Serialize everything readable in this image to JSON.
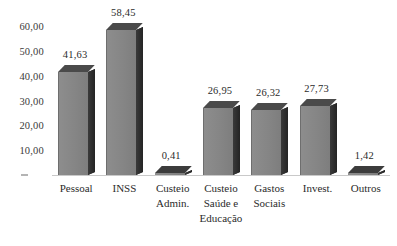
{
  "chart_data": {
    "type": "bar",
    "title": "",
    "subtitle": "",
    "xlabel": "",
    "ylabel": "",
    "categories": [
      "Pessoal",
      "INSS",
      "Custeio Admin.",
      "Custeio Saúde e Educação",
      "Gastos Sociais",
      "Invest.",
      "Outros"
    ],
    "category_lines": [
      [
        "Pessoal"
      ],
      [
        "INSS"
      ],
      [
        "Custeio",
        "Admin."
      ],
      [
        "Custeio",
        "Saúde e",
        "Educação"
      ],
      [
        "Gastos",
        "Sociais"
      ],
      [
        "Invest."
      ],
      [
        "Outros"
      ]
    ],
    "values": [
      41.63,
      58.45,
      0.41,
      26.95,
      26.32,
      27.73,
      1.42
    ],
    "value_labels": [
      "41,63",
      "58,45",
      "0,41",
      "26,95",
      "26,32",
      "27,73",
      "1,42"
    ],
    "ylim": [
      0,
      65
    ],
    "yticks": [
      10,
      20,
      30,
      40,
      50,
      60
    ],
    "ytick_labels": [
      "10,00",
      "20,00",
      "30,00",
      "40,00",
      "50,00",
      "60,00"
    ],
    "grid": false,
    "legend": null,
    "style": "3d-bars-grayscale",
    "colors": {
      "bar_front": "#8a8a8a",
      "bar_side": "#2e2e2e",
      "bar_top": "#4a4a4a",
      "baseline": "#c9c9c9",
      "text": "#2b2b2b",
      "background": "#ffffff"
    }
  }
}
